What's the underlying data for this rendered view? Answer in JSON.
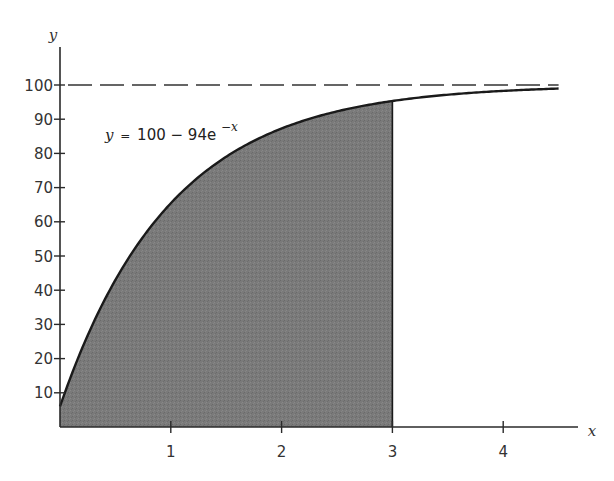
{
  "chart_data": {
    "type": "area",
    "title": "",
    "function": "y = 100 - 94e^{-x}",
    "equation_label": {
      "y": "y",
      "eq": "=",
      "body": "100 − 94e",
      "exponent": "−x"
    },
    "xlabel": "x",
    "ylabel": "y",
    "x_ticks": [
      "1",
      "2",
      "3",
      "4"
    ],
    "x_tick_values": [
      1,
      2,
      3,
      4
    ],
    "y_ticks": [
      "10",
      "20",
      "30",
      "40",
      "50",
      "60",
      "70",
      "80",
      "90",
      "100"
    ],
    "y_tick_values": [
      10,
      20,
      30,
      40,
      50,
      60,
      70,
      80,
      90,
      100
    ],
    "xlim": [
      0,
      4.5
    ],
    "ylim": [
      0,
      100
    ],
    "asymptote": {
      "y": 100,
      "style": "dashed"
    },
    "shaded_region": {
      "from_x": 0,
      "to_x": 3,
      "description": "area under curve from x=0 to x=3"
    },
    "curve_samples": {
      "x": [
        0,
        0.5,
        1,
        1.5,
        2,
        2.5,
        3,
        3.5,
        4,
        4.5
      ],
      "y": [
        6,
        42.99,
        65.42,
        79.03,
        87.28,
        92.28,
        95.32,
        97.16,
        98.28,
        98.96
      ]
    },
    "grid": false,
    "legend": null,
    "colors": {
      "curve": "#1a1a1a",
      "fill": "#777777",
      "axis": "#2a2a2a",
      "asymptote": "#333333"
    }
  }
}
